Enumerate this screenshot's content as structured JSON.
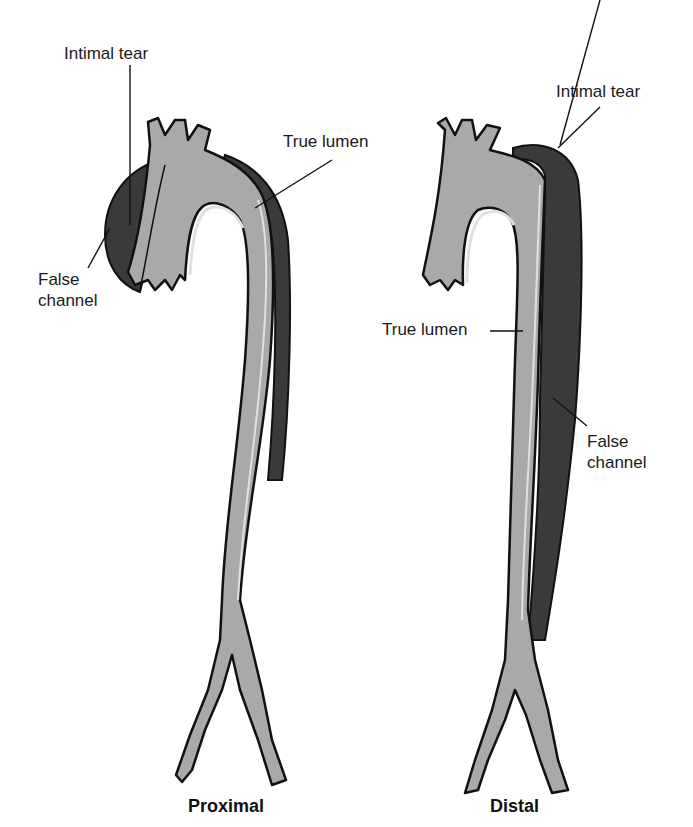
{
  "figure": {
    "colors": {
      "true_lumen": "#a9a9a9",
      "false_channel": "#3a3a3a",
      "outline": "#111111",
      "wall": "#d8d8d8"
    },
    "panels": [
      {
        "caption": "Proximal",
        "labels": {
          "intimal_tear": "Intimal tear",
          "true_lumen": "True lumen",
          "false_channel_line1": "False",
          "false_channel_line2": "channel"
        }
      },
      {
        "caption": "Distal",
        "labels": {
          "intimal_tear": "Intimal tear",
          "true_lumen": "True lumen",
          "false_channel_line1": "False",
          "false_channel_line2": "channel"
        }
      }
    ]
  }
}
